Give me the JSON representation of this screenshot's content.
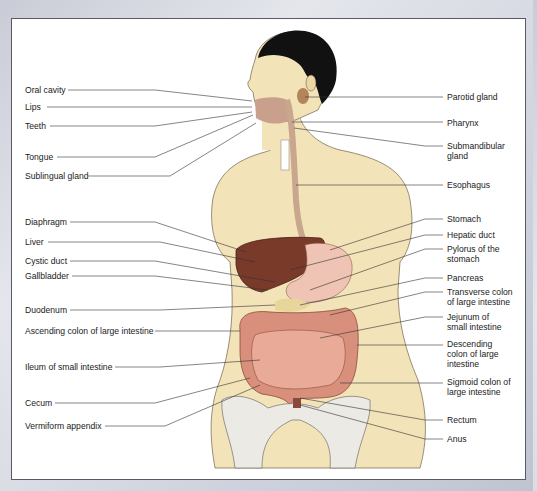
{
  "figure": {
    "colors": {
      "skin": "#f3e3b8",
      "hair": "#111111",
      "liver": "#7a3a2a",
      "stomach": "#f0c4b4",
      "intestine": "#d8907c",
      "pancreas": "#e8d59a",
      "bone": "#eceae4",
      "esophagus": "#c9a68e",
      "leader_line": "#333333"
    }
  },
  "labels_left": [
    {
      "text": "Oral cavity",
      "y": 90
    },
    {
      "text": "Lips",
      "y": 107
    },
    {
      "text": "Teeth",
      "y": 126
    },
    {
      "text": "Tongue",
      "y": 157
    },
    {
      "text": "Sublingual gland",
      "y": 176
    },
    {
      "text": "Diaphragm",
      "y": 222
    },
    {
      "text": "Liver",
      "y": 242
    },
    {
      "text": "Cystic duct",
      "y": 261
    },
    {
      "text": "Gallbladder",
      "y": 276
    },
    {
      "text": "Duodenum",
      "y": 310
    },
    {
      "text": "Ascending colon of large intestine",
      "y": 331
    },
    {
      "text": "Ileum of small intestine",
      "y": 367
    },
    {
      "text": "Cecum",
      "y": 403
    },
    {
      "text": "Vermiform appendix",
      "y": 426
    }
  ],
  "labels_right": [
    {
      "text": "Parotid gland",
      "y": 97
    },
    {
      "text": "Pharynx",
      "y": 123
    },
    {
      "text": "Submandibular gland",
      "y": 146
    },
    {
      "text": "Esophagus",
      "y": 185
    },
    {
      "text": "Stomach",
      "y": 219
    },
    {
      "text": "Hepatic duct",
      "y": 235
    },
    {
      "text": "Pylorus of the stomach",
      "y": 249
    },
    {
      "text": "Pancreas",
      "y": 278
    },
    {
      "text": "Transverse colon of large intestine",
      "y": 292
    },
    {
      "text": "Jejunum of small intestine",
      "y": 317
    },
    {
      "text": "Descending colon of large intestine",
      "y": 344
    },
    {
      "text": "Sigmoid colon of large intestine",
      "y": 382
    },
    {
      "text": "Rectum",
      "y": 420
    },
    {
      "text": "Anus",
      "y": 439
    }
  ]
}
